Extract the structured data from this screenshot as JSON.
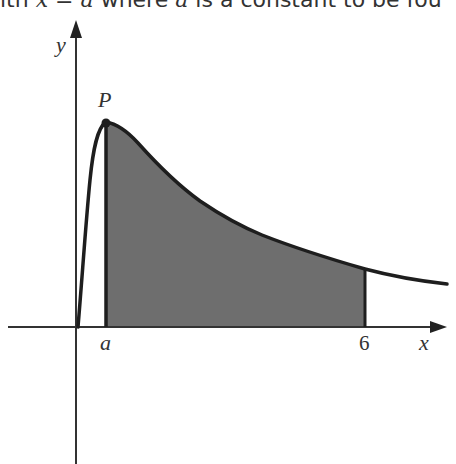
{
  "caption": {
    "prefix": "ith ",
    "var1": "x",
    "eq": " = ",
    "var2": "a",
    "mid": " where ",
    "var3": "a",
    "suffix": " is a constant to be fou"
  },
  "diagram": {
    "axis_labels": {
      "x": "x",
      "y": "y"
    },
    "point_label": "P",
    "tick_labels": {
      "a": "a",
      "six": "6"
    },
    "colors": {
      "shade": "#6e6e6e",
      "line": "#1e1e1e",
      "axis": "#333333"
    }
  }
}
